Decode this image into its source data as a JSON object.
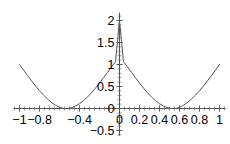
{
  "chart_data": {
    "type": "line",
    "title": "",
    "subtitle": "",
    "xlabel": "",
    "ylabel": "",
    "xlim": [
      -1.06,
      1.06
    ],
    "ylim": [
      -0.62,
      2.18
    ],
    "grid": false,
    "legend": null,
    "legend_position": "none",
    "axis_style": "crossing-axes-at-origin",
    "line_color": "#555555",
    "axis_color": "#555555",
    "background_color": "#ffffff",
    "x_ticks": [
      {
        "value": -1,
        "label": "-1"
      },
      {
        "value": -0.8,
        "label": "-0.8"
      },
      {
        "value": -0.4,
        "label": "-0.4"
      },
      {
        "value": 0,
        "label": "0"
      },
      {
        "value": 0.2,
        "label": "0.2"
      },
      {
        "value": 0.4,
        "label": "0.4"
      },
      {
        "value": 0.6,
        "label": "0.6"
      },
      {
        "value": 0.8,
        "label": "0.8"
      },
      {
        "value": 1,
        "label": "1"
      }
    ],
    "y_ticks": [
      {
        "value": 2,
        "label": "2"
      },
      {
        "value": 1.5,
        "label": "1.5"
      },
      {
        "value": 1,
        "label": "1"
      },
      {
        "value": 0.5,
        "label": "0.5"
      },
      {
        "value": 0,
        "label": "0"
      },
      {
        "value": -0.5,
        "label": "-0.5"
      }
    ],
    "x_minor_tick_step": 0.05,
    "y_minor_tick_step": 0.1,
    "series": [
      {
        "name": "curve",
        "color": "#555555",
        "x": [
          -1.0,
          -0.96,
          -0.92,
          -0.88,
          -0.84,
          -0.8,
          -0.78,
          -0.76,
          -0.72,
          -0.68,
          -0.64,
          -0.6,
          -0.56,
          -0.52,
          -0.48,
          -0.44,
          -0.4,
          -0.36,
          -0.32,
          -0.28,
          -0.24,
          -0.2,
          -0.16,
          -0.12,
          -0.08,
          -0.04,
          0.0,
          0.04,
          0.08,
          0.12,
          0.16,
          0.2,
          0.24,
          0.28,
          0.32,
          0.36,
          0.4,
          0.44,
          0.48,
          0.52,
          0.56,
          0.6,
          0.64,
          0.68,
          0.72,
          0.76,
          0.78,
          0.8,
          0.84,
          0.88,
          0.92,
          0.96,
          1.0
        ],
        "y": [
          1.0,
          0.874,
          0.749,
          0.629,
          0.513,
          0.405,
          0.354,
          0.305,
          0.215,
          0.138,
          0.074,
          0.024,
          0.0,
          0.0,
          0.019,
          0.056,
          0.109,
          0.178,
          0.262,
          0.357,
          0.464,
          0.578,
          0.698,
          0.821,
          0.944,
          1.067,
          2.0,
          1.067,
          0.944,
          0.821,
          0.698,
          0.578,
          0.464,
          0.357,
          0.262,
          0.178,
          0.109,
          0.056,
          0.019,
          0.0,
          0.0,
          0.024,
          0.074,
          0.138,
          0.215,
          0.305,
          0.354,
          0.405,
          0.513,
          0.629,
          0.749,
          0.874,
          1.0
        ],
        "description": "smooth symmetric curve peaking at (0, 2), touching zero near x = -0.78 and x = 0.78, rising back to y = 1 at x = -1 and x = 1"
      }
    ],
    "annotations": [],
    "key_points": [
      {
        "label": "peak",
        "x": 0,
        "y": 2
      },
      {
        "label": "left-minimum",
        "x": -0.78,
        "y": 0
      },
      {
        "label": "right-minimum",
        "x": 0.78,
        "y": 0
      },
      {
        "label": "left-endpoint",
        "x": -1,
        "y": 1
      },
      {
        "label": "right-endpoint",
        "x": 1,
        "y": 1
      }
    ]
  }
}
